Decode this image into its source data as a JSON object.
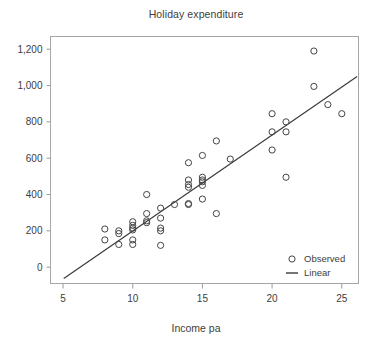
{
  "chart_data": {
    "type": "scatter",
    "title": "Holiday expenditure",
    "xlabel": "Income pa",
    "ylabel": "",
    "xlim": [
      4.1,
      26.2
    ],
    "ylim": [
      -90,
      1270
    ],
    "grid": false,
    "xticks": [
      "5",
      "10",
      "15",
      "20",
      "25"
    ],
    "xtickvalues": [
      5,
      10,
      15,
      20,
      25
    ],
    "yticks": [
      "0",
      "200",
      "400",
      "600",
      "800",
      "1,000",
      "1,200"
    ],
    "ytickvalues": [
      0,
      200,
      400,
      600,
      800,
      1000,
      1200
    ],
    "legend_position": "bottom-right",
    "series": [
      {
        "name": "Observed",
        "type": "scatter",
        "marker": "open-circle",
        "color": "#444444",
        "points": [
          [
            8,
            210
          ],
          [
            8,
            150
          ],
          [
            9,
            200
          ],
          [
            9,
            185
          ],
          [
            9,
            125
          ],
          [
            10,
            250
          ],
          [
            10,
            230
          ],
          [
            10,
            215
          ],
          [
            10,
            205
          ],
          [
            10,
            150
          ],
          [
            10,
            125
          ],
          [
            11,
            400
          ],
          [
            11,
            295
          ],
          [
            11,
            255
          ],
          [
            11,
            245
          ],
          [
            12,
            325
          ],
          [
            12,
            270
          ],
          [
            12,
            215
          ],
          [
            12,
            200
          ],
          [
            12,
            120
          ],
          [
            13,
            345
          ],
          [
            14,
            575
          ],
          [
            14,
            480
          ],
          [
            14,
            455
          ],
          [
            14,
            440
          ],
          [
            14,
            345
          ],
          [
            14,
            350
          ],
          [
            15,
            615
          ],
          [
            15,
            495
          ],
          [
            15,
            480
          ],
          [
            15,
            470
          ],
          [
            15,
            450
          ],
          [
            15,
            375
          ],
          [
            16,
            695
          ],
          [
            16,
            295
          ],
          [
            17,
            595
          ],
          [
            20,
            845
          ],
          [
            20,
            745
          ],
          [
            20,
            645
          ],
          [
            21,
            800
          ],
          [
            21,
            745
          ],
          [
            21,
            495
          ],
          [
            23,
            1190
          ],
          [
            23,
            995
          ],
          [
            24,
            895
          ],
          [
            25,
            845
          ]
        ]
      },
      {
        "name": "Linear",
        "type": "line",
        "color": "#3a3a3a",
        "endpoints": [
          [
            5.05,
            -62
          ],
          [
            26.1,
            1050
          ]
        ]
      }
    ]
  },
  "legend": {
    "items": [
      {
        "label": "Observed",
        "marker": "open-circle"
      },
      {
        "label": "Linear",
        "marker": "line"
      }
    ]
  },
  "colors": {
    "axis": "#9b9b9b",
    "text": "#3d3d3d",
    "marker": "#444444",
    "line": "#3a3a3a",
    "background": "#ffffff"
  }
}
